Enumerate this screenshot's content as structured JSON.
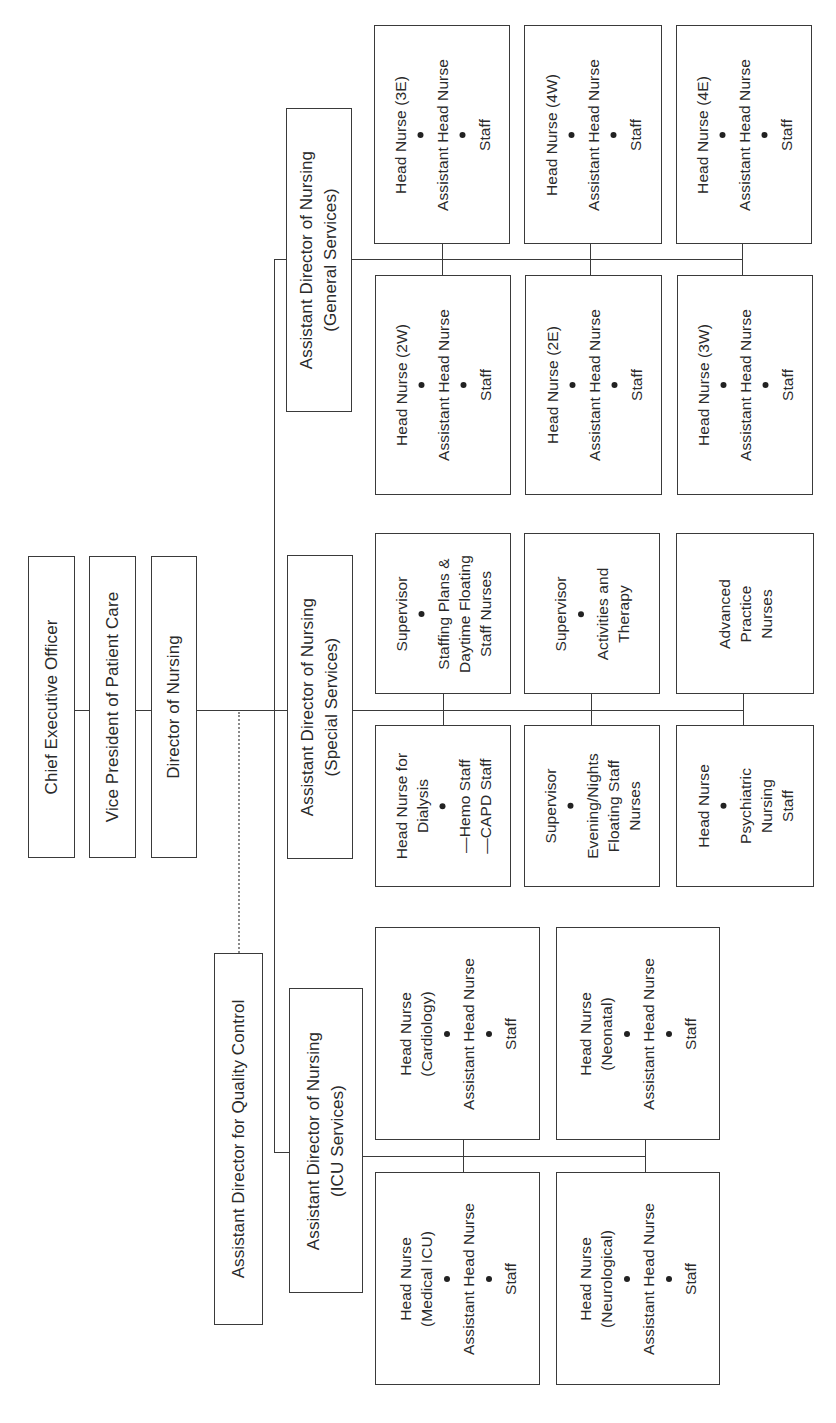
{
  "chart": {
    "orientation": "rotated-90-ccw"
  },
  "executives": {
    "ceo": "Chief Executive Officer",
    "vp": "Vice President of Patient Care",
    "don": "Director of Nursing",
    "qc": "Assistant Director for Quality Control"
  },
  "general": {
    "adon": [
      "Assistant Director of Nursing",
      "(General Services)"
    ],
    "units": [
      {
        "lines": [
          "Head Nurse (3E)",
          "Assistant Head Nurse",
          "Staff"
        ]
      },
      {
        "lines": [
          "Head Nurse (4W)",
          "Assistant Head Nurse",
          "Staff"
        ]
      },
      {
        "lines": [
          "Head Nurse (4E)",
          "Assistant Head Nurse",
          "Staff"
        ]
      },
      {
        "lines": [
          "Head Nurse (2W)",
          "Assistant Head Nurse",
          "Staff"
        ]
      },
      {
        "lines": [
          "Head Nurse (2E)",
          "Assistant Head Nurse",
          "Staff"
        ]
      },
      {
        "lines": [
          "Head Nurse (3W)",
          "Assistant Head Nurse",
          "Staff"
        ]
      }
    ]
  },
  "special": {
    "adon": [
      "Assistant Director of Nursing",
      "(Special Services)"
    ],
    "units": [
      {
        "head": "Supervisor",
        "body": [
          "Staffing Plans &",
          "Daytime Floating",
          "Staff Nurses"
        ]
      },
      {
        "head": "Supervisor",
        "body": [
          "Activities and",
          "Therapy"
        ]
      },
      {
        "head": "",
        "body": [
          "Advanced",
          "Practice",
          "Nurses"
        ]
      },
      {
        "head": "Head Nurse for\nDialysis",
        "head_lines": [
          "Head Nurse for",
          "Dialysis"
        ],
        "body": [
          "—Hemo Staff",
          "—CAPD Staff"
        ]
      },
      {
        "head": "Supervisor",
        "body": [
          "Evening/Nights",
          "Floating Staff",
          "Nurses"
        ]
      },
      {
        "head": "Head Nurse",
        "body": [
          "Psychiatric",
          "Nursing",
          "Staff"
        ]
      }
    ]
  },
  "icu": {
    "adon": [
      "Assistant Director of Nursing",
      "(ICU Services)"
    ],
    "units": [
      {
        "head_lines": [
          "Head Nurse",
          "(Cardiology)"
        ],
        "mid": "Assistant Head Nurse",
        "tail": "Staff"
      },
      {
        "head_lines": [
          "Head Nurse",
          "(Neonatal)"
        ],
        "mid": "Assistant Head Nurse",
        "tail": "Staff"
      },
      {
        "head_lines": [
          "Head Nurse",
          "(Medical ICU)"
        ],
        "mid": "Assistant Head Nurse",
        "tail": "Staff"
      },
      {
        "head_lines": [
          "Head Nurse",
          "(Neurological)"
        ],
        "mid": "Assistant Head Nurse",
        "tail": "Staff"
      }
    ]
  }
}
